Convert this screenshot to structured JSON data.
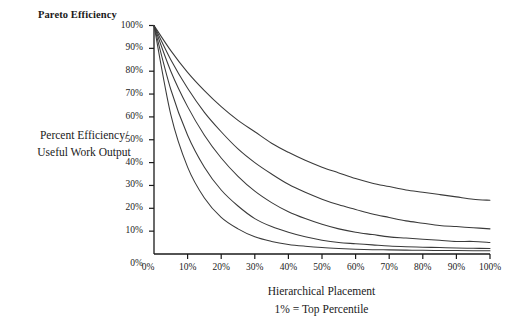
{
  "chart_data": {
    "type": "line",
    "title": "Pareto Efficiency",
    "xlabel": "Hierarchical Placement",
    "xlabel_sub": "1% = Top Percentile",
    "ylabel_line1": "Percent Efficiency/",
    "ylabel_line2": "Useful Work Output",
    "xlim": [
      0,
      100
    ],
    "ylim": [
      0,
      100
    ],
    "grid": false,
    "legend": "none",
    "line_color": "#3a3a3a",
    "axis_color": "#1a1a1a",
    "background": "#ffffff",
    "x_ticks": [
      "0%",
      "10%",
      "20%",
      "30%",
      "40%",
      "50%",
      "60%",
      "70%",
      "80%",
      "90%",
      "100%"
    ],
    "x_tick_values": [
      0,
      10,
      20,
      30,
      40,
      50,
      60,
      70,
      80,
      90,
      100
    ],
    "y_ticks": [
      "0%",
      "10%",
      "20%",
      "30%",
      "40%",
      "50%",
      "60%",
      "70%",
      "80%",
      "90%",
      "100%"
    ],
    "y_tick_values": [
      0,
      10,
      20,
      30,
      40,
      50,
      60,
      70,
      80,
      90,
      100
    ],
    "x": [
      0,
      5,
      10,
      15,
      20,
      25,
      30,
      35,
      40,
      45,
      50,
      55,
      60,
      65,
      70,
      75,
      80,
      85,
      90,
      95,
      100
    ],
    "series": [
      {
        "name": "curve-1-slowest-decay",
        "asymptote": 22,
        "values": [
          100,
          89,
          79.5,
          71.5,
          64.5,
          58.5,
          53.5,
          48.5,
          44.5,
          41,
          38,
          35.5,
          33,
          31,
          29.5,
          28,
          27,
          26,
          25,
          24,
          23.5
        ]
      },
      {
        "name": "curve-2",
        "asymptote": 7,
        "values": [
          100,
          85,
          72.5,
          62,
          53.5,
          46,
          40,
          35,
          30.5,
          27,
          24,
          21.5,
          19.5,
          17.5,
          16,
          14.5,
          13.5,
          12.5,
          12,
          11.5,
          11
        ]
      },
      {
        "name": "curve-3",
        "asymptote": 3,
        "values": [
          100,
          80,
          64.5,
          52,
          42,
          34,
          27.5,
          22.5,
          18.5,
          15.5,
          13,
          11,
          9.5,
          8.5,
          7.5,
          7,
          6.5,
          6,
          5.5,
          5.5,
          5
        ]
      },
      {
        "name": "curve-4",
        "asymptote": 1.5,
        "values": [
          100,
          72,
          52,
          38,
          28,
          21,
          15.5,
          12,
          9.5,
          7.5,
          6,
          5,
          4.5,
          4,
          3.5,
          3.2,
          3,
          2.8,
          2.6,
          2.5,
          2.4
        ]
      },
      {
        "name": "curve-5-fastest-decay",
        "asymptote": 0.8,
        "values": [
          100,
          61,
          38,
          24.5,
          16,
          11,
          7.5,
          5.5,
          4.2,
          3.4,
          2.8,
          2.4,
          2.1,
          1.9,
          1.8,
          1.7,
          1.6,
          1.55,
          1.5,
          1.45,
          1.4
        ]
      }
    ]
  },
  "axes": {
    "y_axis_name": "y-axis",
    "x_axis_name": "x-axis"
  }
}
